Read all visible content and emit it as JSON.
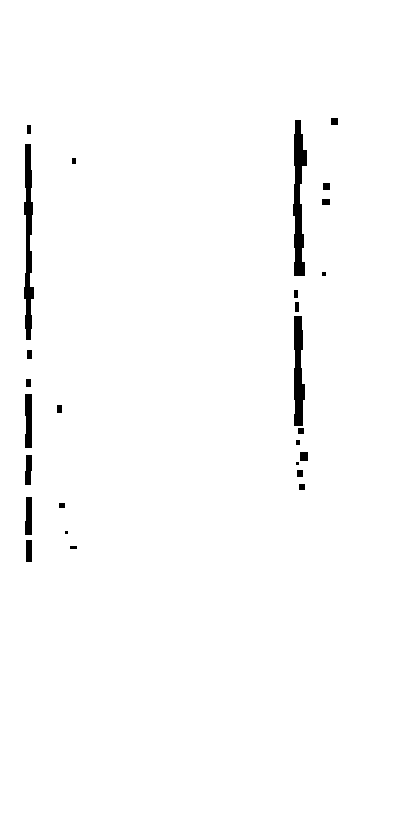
{
  "page": {
    "kind": "scanned-document-page",
    "condition": "severely degraded binary scan; body text lost to thresholding",
    "width_px": 414,
    "height_px": 831,
    "background_color": "#ffffff",
    "ink_color": "#000000",
    "legible_text": "",
    "blank_region_note": "lower portion of page is blank white"
  },
  "ink": {
    "left_column": {
      "label": "left-column-ink-trace",
      "x": 24,
      "width": 9,
      "top": 125,
      "bottom": 562,
      "segments": [
        {
          "y": 125,
          "h": 9,
          "x": 27,
          "w": 4
        },
        {
          "y": 144,
          "h": 26,
          "x": 25,
          "w": 6
        },
        {
          "y": 170,
          "h": 18,
          "x": 25,
          "w": 7
        },
        {
          "y": 188,
          "h": 14,
          "x": 26,
          "w": 5
        },
        {
          "y": 202,
          "h": 13,
          "x": 24,
          "w": 9
        },
        {
          "y": 215,
          "h": 20,
          "x": 26,
          "w": 6
        },
        {
          "y": 235,
          "h": 16,
          "x": 26,
          "w": 4
        },
        {
          "y": 251,
          "h": 22,
          "x": 26,
          "w": 6
        },
        {
          "y": 273,
          "h": 14,
          "x": 25,
          "w": 5
        },
        {
          "y": 287,
          "h": 12,
          "x": 24,
          "w": 10
        },
        {
          "y": 299,
          "h": 16,
          "x": 26,
          "w": 5
        },
        {
          "y": 315,
          "h": 14,
          "x": 25,
          "w": 7
        },
        {
          "y": 329,
          "h": 11,
          "x": 26,
          "w": 5
        },
        {
          "y": 350,
          "h": 9,
          "x": 27,
          "w": 5
        },
        {
          "y": 379,
          "h": 8,
          "x": 26,
          "w": 5
        },
        {
          "y": 394,
          "h": 22,
          "x": 25,
          "w": 7
        },
        {
          "y": 416,
          "h": 18,
          "x": 26,
          "w": 6
        },
        {
          "y": 434,
          "h": 14,
          "x": 25,
          "w": 7
        },
        {
          "y": 455,
          "h": 16,
          "x": 26,
          "w": 6
        },
        {
          "y": 471,
          "h": 14,
          "x": 25,
          "w": 6
        },
        {
          "y": 497,
          "h": 24,
          "x": 26,
          "w": 6
        },
        {
          "y": 521,
          "h": 14,
          "x": 25,
          "w": 7
        },
        {
          "y": 540,
          "h": 22,
          "x": 26,
          "w": 6
        }
      ]
    },
    "right_column": {
      "label": "right-column-ink-trace",
      "x": 293,
      "width": 13,
      "top": 120,
      "bottom": 490,
      "segments": [
        {
          "y": 120,
          "h": 14,
          "x": 295,
          "w": 6
        },
        {
          "y": 134,
          "h": 16,
          "x": 294,
          "w": 9
        },
        {
          "y": 150,
          "h": 16,
          "x": 294,
          "w": 13
        },
        {
          "y": 166,
          "h": 18,
          "x": 295,
          "w": 7
        },
        {
          "y": 184,
          "h": 20,
          "x": 294,
          "w": 6
        },
        {
          "y": 204,
          "h": 12,
          "x": 293,
          "w": 9
        },
        {
          "y": 216,
          "h": 18,
          "x": 295,
          "w": 7
        },
        {
          "y": 234,
          "h": 14,
          "x": 294,
          "w": 10
        },
        {
          "y": 248,
          "h": 14,
          "x": 295,
          "w": 7
        },
        {
          "y": 262,
          "h": 14,
          "x": 294,
          "w": 11
        },
        {
          "y": 290,
          "h": 8,
          "x": 294,
          "w": 4
        },
        {
          "y": 302,
          "h": 10,
          "x": 295,
          "w": 4
        },
        {
          "y": 316,
          "h": 14,
          "x": 294,
          "w": 8
        },
        {
          "y": 330,
          "h": 20,
          "x": 294,
          "w": 9
        },
        {
          "y": 350,
          "h": 18,
          "x": 295,
          "w": 6
        },
        {
          "y": 368,
          "h": 16,
          "x": 294,
          "w": 8
        },
        {
          "y": 384,
          "h": 16,
          "x": 294,
          "w": 11
        },
        {
          "y": 400,
          "h": 14,
          "x": 295,
          "w": 8
        },
        {
          "y": 414,
          "h": 12,
          "x": 294,
          "w": 9
        }
      ]
    },
    "specks": [
      {
        "name": "speck-left-upper",
        "x": 72,
        "y": 158,
        "w": 4,
        "h": 6
      },
      {
        "name": "speck-left-mid",
        "x": 57,
        "y": 405,
        "w": 5,
        "h": 8
      },
      {
        "name": "speck-left-low-a",
        "x": 59,
        "y": 503,
        "w": 6,
        "h": 5
      },
      {
        "name": "speck-left-low-b",
        "x": 65,
        "y": 531,
        "w": 3,
        "h": 3
      },
      {
        "name": "speck-left-low-c",
        "x": 70,
        "y": 546,
        "w": 7,
        "h": 3
      },
      {
        "name": "speck-right-top",
        "x": 331,
        "y": 118,
        "w": 7,
        "h": 7
      },
      {
        "name": "speck-right-mid-a",
        "x": 323,
        "y": 183,
        "w": 7,
        "h": 7
      },
      {
        "name": "speck-right-mid-b",
        "x": 322,
        "y": 199,
        "w": 8,
        "h": 6
      },
      {
        "name": "speck-right-low",
        "x": 322,
        "y": 272,
        "w": 4,
        "h": 4
      },
      {
        "name": "speck-tail-a",
        "x": 298,
        "y": 428,
        "w": 6,
        "h": 6
      },
      {
        "name": "speck-tail-b",
        "x": 296,
        "y": 440,
        "w": 4,
        "h": 5
      },
      {
        "name": "speck-tail-c",
        "x": 300,
        "y": 452,
        "w": 8,
        "h": 9
      },
      {
        "name": "speck-tail-d",
        "x": 297,
        "y": 470,
        "w": 6,
        "h": 7
      },
      {
        "name": "speck-tail-e",
        "x": 299,
        "y": 484,
        "w": 6,
        "h": 6
      },
      {
        "name": "speck-tail-f",
        "x": 296,
        "y": 462,
        "w": 3,
        "h": 3
      }
    ]
  }
}
